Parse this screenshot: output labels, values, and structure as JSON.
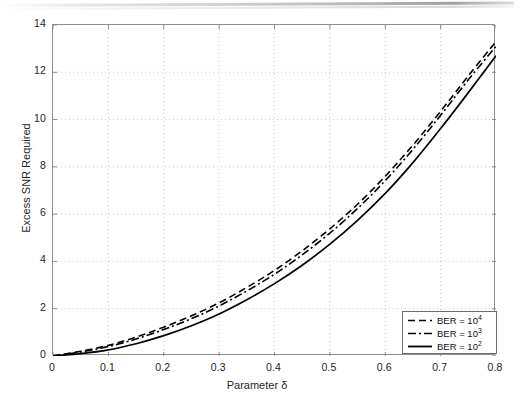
{
  "figure": {
    "background": "#ffffff",
    "axis_color": "#8e8e8e",
    "grid_color": "#c9c9c9",
    "line_color": "#000000"
  },
  "axes": {
    "x_title_prefix": "Parameter ",
    "x_title_symbol": "δ",
    "y_title": "Excess SNR Required",
    "x_ticks": [
      "0",
      "0.1",
      "0.2",
      "0.3",
      "0.4",
      "0.5",
      "0.6",
      "0.7",
      "0.8"
    ],
    "y_ticks": [
      "0",
      "2",
      "4",
      "6",
      "8",
      "10",
      "12",
      "14"
    ]
  },
  "legend": {
    "entries": [
      {
        "label_base": "BER = 10",
        "exponent": "4",
        "style": "dashed",
        "name": "legend-entry-ber-1e4"
      },
      {
        "label_base": "BER = 10",
        "exponent": "3",
        "style": "dashdot",
        "name": "legend-entry-ber-1e3"
      },
      {
        "label_base": "BER = 10",
        "exponent": "2",
        "style": "solid",
        "name": "legend-entry-ber-1e2"
      }
    ]
  },
  "chart_data": {
    "type": "line",
    "title": "",
    "xlabel": "Parameter δ",
    "ylabel": "Excess SNR Required",
    "xlim": [
      0,
      0.8
    ],
    "ylim": [
      0,
      14
    ],
    "xticks": [
      0,
      0.1,
      0.2,
      0.3,
      0.4,
      0.5,
      0.6,
      0.7,
      0.8
    ],
    "yticks": [
      0,
      2,
      4,
      6,
      8,
      10,
      12,
      14
    ],
    "grid": true,
    "grid_style": "dotted",
    "legend_position": "lower right",
    "x": [
      0,
      0.05,
      0.1,
      0.15,
      0.2,
      0.25,
      0.3,
      0.35,
      0.4,
      0.45,
      0.5,
      0.55,
      0.6,
      0.65,
      0.7,
      0.75,
      0.8
    ],
    "series": [
      {
        "name": "BER = 10^4",
        "style": "dashed",
        "color": "#000000",
        "values": [
          0.0,
          0.2,
          0.45,
          0.8,
          1.22,
          1.7,
          2.25,
          2.9,
          3.62,
          4.45,
          5.38,
          6.42,
          7.6,
          8.92,
          10.35,
          11.85,
          13.3
        ]
      },
      {
        "name": "BER = 10^3",
        "style": "dashdot",
        "color": "#000000",
        "values": [
          0.0,
          0.17,
          0.4,
          0.72,
          1.12,
          1.58,
          2.12,
          2.75,
          3.46,
          4.28,
          5.2,
          6.24,
          7.42,
          8.74,
          10.18,
          11.68,
          13.1
        ]
      },
      {
        "name": "BER = 10^2",
        "style": "solid",
        "color": "#000000",
        "values": [
          0.0,
          0.1,
          0.26,
          0.52,
          0.86,
          1.28,
          1.78,
          2.38,
          3.06,
          3.84,
          4.73,
          5.74,
          6.88,
          8.18,
          9.62,
          11.14,
          12.7
        ]
      }
    ]
  }
}
